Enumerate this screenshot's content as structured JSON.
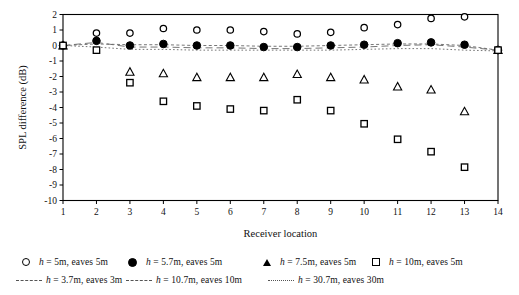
{
  "chart_data": {
    "type": "scatter",
    "title": "",
    "xlabel": "Receiver location",
    "ylabel": "SPL difference (dB)",
    "xlim": [
      1,
      14
    ],
    "ylim": [
      -10,
      2
    ],
    "xticks": [
      1,
      2,
      3,
      4,
      5,
      6,
      7,
      8,
      9,
      10,
      11,
      12,
      13,
      14
    ],
    "yticks": [
      2,
      1,
      0,
      -1,
      -2,
      -3,
      -4,
      -5,
      -6,
      -7,
      -8,
      -9,
      -10
    ],
    "grid": false,
    "legend_position": "below-axes",
    "x": [
      1,
      2,
      3,
      4,
      5,
      6,
      7,
      8,
      9,
      10,
      11,
      12,
      13,
      14
    ],
    "series": [
      {
        "name": "h = 5m, eaves 5m",
        "marker": "circle-open",
        "style": "markers",
        "values": [
          0.0,
          0.8,
          0.8,
          1.1,
          1.0,
          1.0,
          0.9,
          0.75,
          0.85,
          1.15,
          1.35,
          1.75,
          1.85,
          -0.3
        ]
      },
      {
        "name": "h = 5.7m, eaves 5m",
        "marker": "circle-filled",
        "style": "markers",
        "values": [
          0.0,
          0.3,
          0.0,
          0.1,
          0.0,
          0.0,
          -0.1,
          -0.1,
          0.0,
          0.05,
          0.15,
          0.2,
          0.05,
          -0.3
        ]
      },
      {
        "name": "h = 7.5m, eaves 5m",
        "marker": "triangle-open",
        "style": "markers",
        "values": [
          0.0,
          null,
          -1.7,
          -1.8,
          -2.05,
          -2.05,
          -2.05,
          -1.85,
          -2.05,
          -2.2,
          -2.65,
          -2.85,
          -4.25,
          -0.3
        ]
      },
      {
        "name": "h = 10m, eaves 5m",
        "marker": "square-open",
        "style": "markers",
        "values": [
          0.0,
          -0.3,
          -2.4,
          -3.6,
          -3.9,
          -4.1,
          -4.2,
          -3.5,
          -4.2,
          -5.05,
          -6.05,
          -6.85,
          -7.85,
          -0.3
        ]
      },
      {
        "name": "h = 3.7m, eaves 3m",
        "marker": "none",
        "style": "dashed-line",
        "values": [
          0.0,
          0.1,
          0.05,
          0.05,
          0.0,
          0.0,
          -0.05,
          -0.05,
          0.0,
          0.05,
          0.1,
          0.1,
          0.0,
          -0.3
        ]
      },
      {
        "name": "h = 10.7m, eaves 10m",
        "marker": "none",
        "style": "long-dashed-line",
        "values": [
          0.0,
          0.2,
          -0.1,
          -0.1,
          -0.15,
          -0.15,
          -0.2,
          -0.2,
          -0.15,
          -0.1,
          0.0,
          0.05,
          -0.1,
          -0.3
        ]
      },
      {
        "name": "h = 30.7m, eaves 30m",
        "marker": "none",
        "style": "dotted-line",
        "values": [
          0.0,
          -0.1,
          -0.25,
          -0.25,
          -0.3,
          -0.3,
          -0.3,
          -0.3,
          -0.3,
          -0.25,
          -0.2,
          -0.2,
          -0.3,
          -0.35
        ]
      }
    ]
  },
  "axes": {
    "y_label": "SPL difference (dB)",
    "x_label": "Receiver location",
    "y_tick_labels": [
      "2",
      "1",
      "0",
      "-1",
      "-2",
      "-3",
      "-4",
      "-5",
      "-6",
      "-7",
      "-8",
      "-9",
      "-10"
    ],
    "x_tick_labels": [
      "1",
      "2",
      "3",
      "4",
      "5",
      "6",
      "7",
      "8",
      "9",
      "10",
      "11",
      "12",
      "13",
      "14"
    ]
  },
  "legend": {
    "row1": [
      {
        "marker": "circle-open-icon",
        "text_prefix": "h",
        "text_rest": " = 5m, eaves 5m"
      },
      {
        "marker": "circle-filled-icon",
        "text_prefix": "h",
        "text_rest": " = 5.7m, eaves 5m"
      },
      {
        "marker": "triangle-open-icon",
        "text_prefix": "h",
        "text_rest": " = 7.5m, eaves 5m"
      },
      {
        "marker": "square-open-icon",
        "text_prefix": "h",
        "text_rest": " = 10m, eaves 5m"
      }
    ],
    "row2": [
      {
        "marker": "dashed-line-icon",
        "text_prefix": "h",
        "text_rest": " = 3.7m, eaves 3m"
      },
      {
        "marker": "long-dashed-line-icon",
        "text_prefix": "h",
        "text_rest": " = 10.7m, eaves 10m"
      },
      {
        "marker": "dotted-line-icon",
        "text_prefix": "h",
        "text_rest": " = 30.7m, eaves 30m"
      }
    ]
  },
  "colors": {
    "axis": "#000000",
    "marker_stroke": "#000000",
    "marker_fill": "#000000",
    "line_gray": "#666666",
    "background": "#ffffff"
  }
}
